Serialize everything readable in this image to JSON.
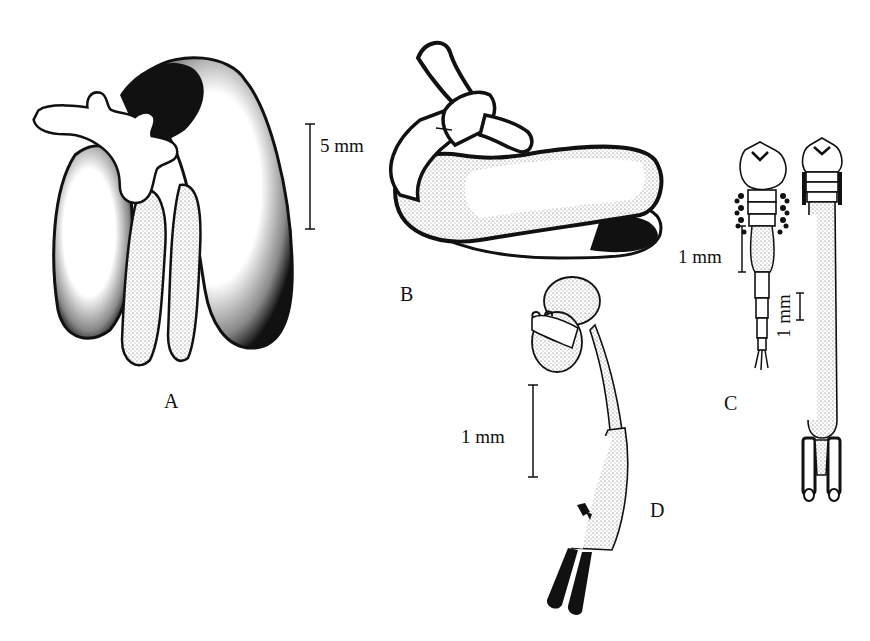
{
  "figure": {
    "panels": [
      {
        "id": "A",
        "label": "A",
        "description": "Spermatophore-like organ with three-lobed branching tube and elongated sacs"
      },
      {
        "id": "B",
        "label": "B",
        "description": "Bent tubular organ with lateral branch and elongated folded sac"
      },
      {
        "id": "C",
        "label": "C",
        "description": "Two elongate segmented specimens, dorsal views"
      },
      {
        "id": "D",
        "label": "D",
        "description": "Curved specimen with bilobed head and dark caudal rami"
      }
    ],
    "scale_bars": {
      "A": {
        "label": "5 mm"
      },
      "C_left": {
        "label": "1 mm"
      },
      "C_right": {
        "label": "1 mm"
      },
      "D": {
        "label": "1 mm"
      }
    },
    "colors": {
      "ink": "#111111",
      "paper": "#ffffff",
      "stipple": "#555555"
    }
  }
}
